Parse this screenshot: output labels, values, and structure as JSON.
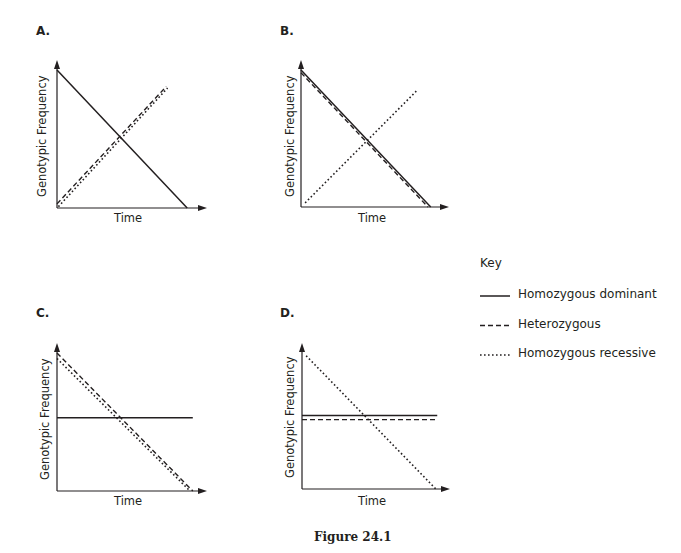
{
  "figure": {
    "caption": "Figure 24.1"
  },
  "key": {
    "title": "Key",
    "entries": [
      {
        "style": "solid",
        "label": "Homozygous dominant"
      },
      {
        "style": "dashed",
        "label": "Heterozygous"
      },
      {
        "style": "dotted",
        "label": "Homozygous recessive"
      }
    ]
  },
  "panels": [
    {
      "label": "A.",
      "ylabel": "Genotypic Frequency",
      "xlabel": "Time"
    },
    {
      "label": "B.",
      "ylabel": "Genotypic Frequency",
      "xlabel": "Time"
    },
    {
      "label": "C.",
      "ylabel": "Genotypic Frequency",
      "xlabel": "Time"
    },
    {
      "label": "D.",
      "ylabel": "Genotypic Frequency",
      "xlabel": "Time"
    }
  ],
  "chart_data": [
    {
      "type": "line",
      "title": "A.",
      "xlabel": "Time",
      "ylabel": "Genotypic Frequency",
      "x": [
        0,
        1
      ],
      "series": [
        {
          "name": "Homozygous dominant",
          "style": "solid",
          "points": [
            [
              0,
              1.0
            ],
            [
              0.93,
              0.0
            ]
          ]
        },
        {
          "name": "Heterozygous",
          "style": "dashed",
          "points": [
            [
              0,
              0.03
            ],
            [
              0.78,
              0.88
            ]
          ]
        },
        {
          "name": "Homozygous recessive",
          "style": "dotted",
          "points": [
            [
              0.01,
              0.01
            ],
            [
              0.79,
              0.87
            ]
          ]
        }
      ],
      "ylim": [
        0,
        1
      ],
      "grid": false,
      "ticks": false
    },
    {
      "type": "line",
      "title": "B.",
      "xlabel": "Time",
      "ylabel": "Genotypic Frequency",
      "series": [
        {
          "name": "Homozygous dominant",
          "style": "solid",
          "points": [
            [
              0,
              1.0
            ],
            [
              0.94,
              0.0
            ]
          ]
        },
        {
          "name": "Heterozygous",
          "style": "dashed",
          "points": [
            [
              0,
              0.98
            ],
            [
              0.92,
              0.0
            ]
          ]
        },
        {
          "name": "Homozygous recessive",
          "style": "dotted",
          "points": [
            [
              0.03,
              0.03
            ],
            [
              0.84,
              0.85
            ]
          ]
        }
      ],
      "ylim": [
        0,
        1
      ],
      "grid": false,
      "ticks": false
    },
    {
      "type": "line",
      "title": "C.",
      "xlabel": "Time",
      "ylabel": "Genotypic Frequency",
      "series": [
        {
          "name": "Homozygous dominant",
          "style": "solid",
          "points": [
            [
              0,
              0.53
            ],
            [
              0.97,
              0.53
            ]
          ]
        },
        {
          "name": "Heterozygous",
          "style": "dashed",
          "points": [
            [
              0,
              1.0
            ],
            [
              0.97,
              0.0
            ]
          ]
        },
        {
          "name": "Homozygous recessive",
          "style": "dotted",
          "points": [
            [
              0,
              0.96
            ],
            [
              0.95,
              0.0
            ]
          ]
        }
      ],
      "ylim": [
        0,
        1
      ],
      "grid": false,
      "ticks": false
    },
    {
      "type": "line",
      "title": "D.",
      "xlabel": "Time",
      "ylabel": "Genotypic Frequency",
      "series": [
        {
          "name": "Homozygous dominant",
          "style": "solid",
          "points": [
            [
              0,
              0.54
            ],
            [
              0.98,
              0.54
            ]
          ]
        },
        {
          "name": "Heterozygous",
          "style": "dashed",
          "points": [
            [
              0,
              0.51
            ],
            [
              0.98,
              0.51
            ]
          ]
        },
        {
          "name": "Homozygous recessive",
          "style": "dotted",
          "points": [
            [
              0.03,
              0.98
            ],
            [
              0.97,
              0.0
            ]
          ]
        }
      ],
      "ylim": [
        0,
        1
      ],
      "grid": false,
      "ticks": false
    }
  ]
}
